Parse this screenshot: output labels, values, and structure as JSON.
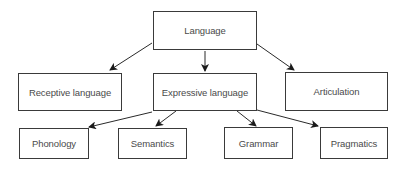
{
  "diagram": {
    "type": "tree",
    "nodes": [
      {
        "id": "language",
        "label": "Language",
        "x": 153,
        "y": 11,
        "w": 104,
        "h": 39
      },
      {
        "id": "receptive",
        "label": "Receptive language",
        "x": 18,
        "y": 73,
        "w": 104,
        "h": 38
      },
      {
        "id": "expressive",
        "label": "Expressive language",
        "x": 153,
        "y": 73,
        "w": 104,
        "h": 38
      },
      {
        "id": "articulation",
        "label": "Articulation",
        "x": 285,
        "y": 72,
        "w": 103,
        "h": 39
      },
      {
        "id": "phonology",
        "label": "Phonology",
        "x": 19,
        "y": 128,
        "w": 70,
        "h": 31
      },
      {
        "id": "semantics",
        "label": "Semantics",
        "x": 118,
        "y": 128,
        "w": 69,
        "h": 31
      },
      {
        "id": "grammar",
        "label": "Grammar",
        "x": 224,
        "y": 127,
        "w": 69,
        "h": 32
      },
      {
        "id": "pragmatics",
        "label": "Pragmatics",
        "x": 320,
        "y": 127,
        "w": 68,
        "h": 32
      }
    ],
    "edges": [
      {
        "from": "language",
        "to": "receptive",
        "x1": 152,
        "y1": 43,
        "x2": 110,
        "y2": 70
      },
      {
        "from": "language",
        "to": "expressive",
        "x1": 205,
        "y1": 51,
        "x2": 205,
        "y2": 71
      },
      {
        "from": "language",
        "to": "articulation",
        "x1": 257,
        "y1": 44,
        "x2": 294,
        "y2": 70
      },
      {
        "from": "expressive",
        "to": "phonology",
        "x1": 152,
        "y1": 112,
        "x2": 89,
        "y2": 127
      },
      {
        "from": "expressive",
        "to": "semantics",
        "x1": 176,
        "y1": 111,
        "x2": 156,
        "y2": 126
      },
      {
        "from": "expressive",
        "to": "grammar",
        "x1": 237,
        "y1": 111,
        "x2": 256,
        "y2": 126
      },
      {
        "from": "expressive",
        "to": "pragmatics",
        "x1": 257,
        "y1": 110,
        "x2": 318,
        "y2": 126
      }
    ],
    "colors": {
      "line": "#2a2a2a",
      "border": "#3a3a3a",
      "text": "#4a4a4a",
      "background": "#ffffff"
    }
  }
}
